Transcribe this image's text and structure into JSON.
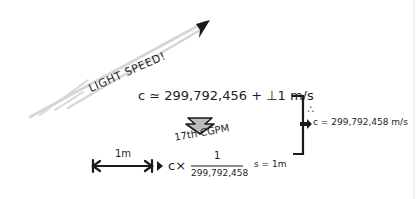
{
  "labels": {
    "light_speed": "LIGHT SPEED!",
    "approx_equation": "c ≃ 299,792,456 + ⊥1 m/s",
    "conference": "17th  CGPM",
    "one_meter": "1m",
    "meter_definition_prefix": "c×",
    "fraction_numerator": "1",
    "fraction_denominator": "299,792,458",
    "meter_definition_suffix": "s = 1m",
    "therefore_symbol": "∴",
    "exact_equation": "c = 299,792,458 m/s"
  },
  "colors": {
    "ink": "#1e1e1e",
    "light_ray": "#d9d9d9",
    "background": "#ffffff"
  }
}
